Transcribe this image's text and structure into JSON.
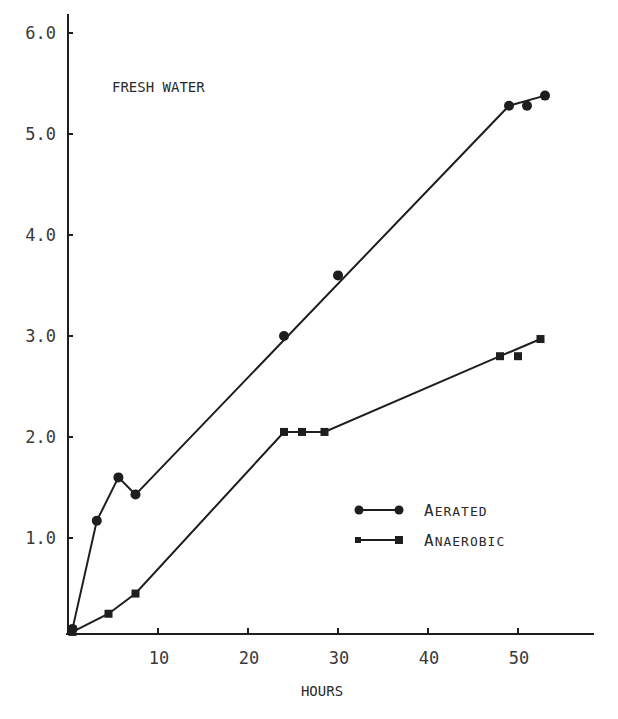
{
  "chart_data": {
    "type": "line",
    "title": "",
    "annotation": "FRESH WATER",
    "xlabel": "HOURS",
    "ylabel": "",
    "xlim": [
      0,
      54
    ],
    "ylim": [
      0,
      6.2
    ],
    "grid": false,
    "x_ticks": [
      10,
      20,
      30,
      40,
      50
    ],
    "x_tick_labels": [
      "10",
      "20",
      "30",
      "40",
      "50"
    ],
    "y_ticks": [
      1.0,
      2.0,
      3.0,
      4.0,
      5.0,
      6.0
    ],
    "y_tick_labels": [
      "1.0",
      "2.0",
      "3.0",
      "4.0",
      "5.0",
      "6.0"
    ],
    "legend_position": "lower right",
    "series": [
      {
        "name": "Aerated",
        "legend_first": "A",
        "legend_rest": "ERATED",
        "marker": "circle",
        "points": [
          [
            0.5,
            0.1
          ],
          [
            3.2,
            1.17
          ],
          [
            5.6,
            1.6
          ],
          [
            7.5,
            1.43
          ],
          [
            24,
            3.0
          ],
          [
            30,
            3.6
          ],
          [
            49,
            5.28
          ],
          [
            51,
            5.28
          ],
          [
            53,
            5.38
          ]
        ],
        "line": [
          [
            0.5,
            0.1
          ],
          [
            3.2,
            1.17
          ],
          [
            5.6,
            1.6
          ],
          [
            7.5,
            1.43
          ],
          [
            49,
            5.28
          ],
          [
            53,
            5.38
          ]
        ]
      },
      {
        "name": "Anaerobic",
        "legend_first": "A",
        "legend_rest": "NAEROBIC",
        "marker": "square",
        "points": [
          [
            0.5,
            0.07
          ],
          [
            4.5,
            0.25
          ],
          [
            7.5,
            0.45
          ],
          [
            24,
            2.05
          ],
          [
            26,
            2.05
          ],
          [
            28.5,
            2.05
          ],
          [
            48,
            2.8
          ],
          [
            50,
            2.8
          ],
          [
            52.5,
            2.97
          ]
        ],
        "line": [
          [
            0.5,
            0.07
          ],
          [
            4.5,
            0.25
          ],
          [
            7.5,
            0.45
          ],
          [
            24,
            2.05
          ],
          [
            28.5,
            2.05
          ],
          [
            48,
            2.8
          ],
          [
            52.5,
            2.97
          ]
        ]
      }
    ]
  }
}
